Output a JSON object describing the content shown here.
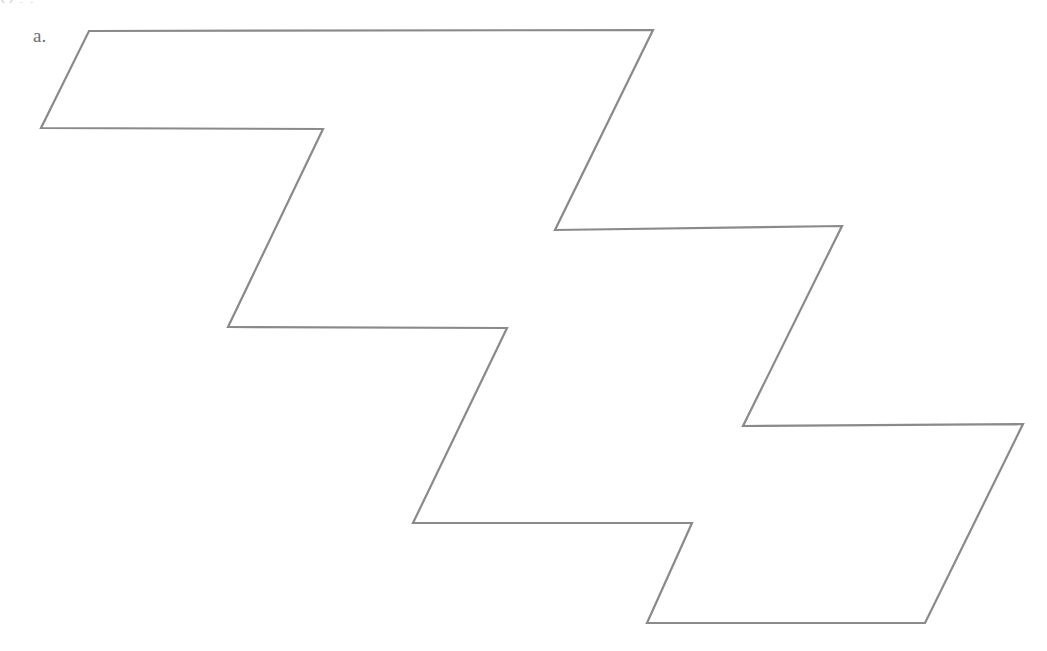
{
  "page": {
    "width": 1047,
    "height": 651,
    "background_color": "#ffffff"
  },
  "cropped_text_line": {
    "text": "Q                              ,                        ,"
  },
  "item": {
    "label": "a.",
    "label_color": "#6f6f6f"
  },
  "figure": {
    "name": "zigzag-staircase-polygon",
    "stroke_color": "#8a8a8a",
    "fill_color": "none",
    "stroke_width": 2.2,
    "vertices": [
      [
        89,
        31
      ],
      [
        653,
        30
      ],
      [
        555,
        230
      ],
      [
        842,
        226
      ],
      [
        743,
        426
      ],
      [
        1023,
        424
      ],
      [
        925,
        623
      ],
      [
        647,
        623
      ],
      [
        692,
        523
      ],
      [
        413,
        523
      ],
      [
        507,
        328
      ],
      [
        228,
        327
      ],
      [
        323,
        129
      ],
      [
        41,
        128
      ]
    ],
    "points_string": "89,31 653,30 555,230 842,226 743,426 1023,424 925,623 647,623 692,523 413,523 507,328 228,327 323,129 41,128"
  }
}
